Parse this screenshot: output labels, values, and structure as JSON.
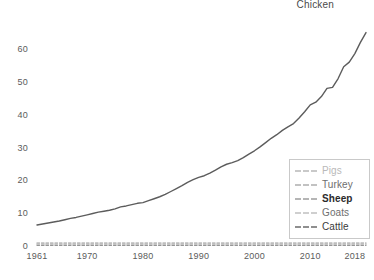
{
  "chart_data": {
    "type": "line",
    "title": "",
    "xlabel": "",
    "ylabel": "",
    "xlim": [
      1961,
      2020
    ],
    "ylim": [
      0,
      70
    ],
    "grid": false,
    "legend_position": "inside-bottom-right",
    "y_ticks": [
      0,
      10,
      20,
      30,
      40,
      50,
      60
    ],
    "y_tick_labels": [
      "0",
      "10",
      "20",
      "30",
      "40",
      "50",
      "60"
    ],
    "x_ticks": [
      1961,
      1970,
      1980,
      1990,
      2000,
      2010,
      2018
    ],
    "x_tick_labels": [
      "1961",
      "1970",
      "1980",
      "1990",
      "2000",
      "2010",
      "2018"
    ],
    "annotations": [
      {
        "text": "Chicken",
        "x": 2014,
        "y": 69
      }
    ],
    "x": [
      1961,
      1962,
      1963,
      1964,
      1965,
      1966,
      1967,
      1968,
      1969,
      1970,
      1971,
      1972,
      1973,
      1974,
      1975,
      1976,
      1977,
      1978,
      1979,
      1980,
      1981,
      1982,
      1983,
      1984,
      1985,
      1986,
      1987,
      1988,
      1989,
      1990,
      1991,
      1992,
      1993,
      1994,
      1995,
      1996,
      1997,
      1998,
      1999,
      2000,
      2001,
      2002,
      2003,
      2004,
      2005,
      2006,
      2007,
      2008,
      2009,
      2010,
      2011,
      2012,
      2013,
      2014,
      2015,
      2016,
      2017,
      2018,
      2019,
      2020
    ],
    "series": [
      {
        "name": "Chicken",
        "color": "#5c5c5c",
        "style": "solid",
        "width": 1.4,
        "values": [
          6.4,
          6.7,
          7.0,
          7.3,
          7.6,
          8.0,
          8.4,
          8.7,
          9.1,
          9.5,
          9.9,
          10.3,
          10.6,
          10.9,
          11.3,
          11.9,
          12.2,
          12.6,
          13.0,
          13.2,
          13.8,
          14.4,
          15.0,
          15.7,
          16.6,
          17.5,
          18.4,
          19.4,
          20.2,
          20.9,
          21.4,
          22.2,
          23.1,
          24.1,
          24.9,
          25.4,
          26.0,
          26.9,
          28.0,
          29.0,
          30.2,
          31.5,
          32.8,
          33.9,
          35.2,
          36.3,
          37.3,
          39.0,
          40.9,
          43.0,
          43.8,
          45.5,
          48.0,
          48.3,
          51.0,
          54.6,
          56.0,
          58.6,
          62.0,
          65.0
        ]
      },
      {
        "name": "Pigs",
        "color": "#cfcfcf",
        "style": "dashed",
        "width": 1.2,
        "values": [
          1.0,
          1.0,
          1.0,
          1.0,
          1.0,
          1.0,
          1.0,
          1.0,
          1.0,
          1.0,
          1.0,
          1.0,
          1.0,
          1.0,
          1.0,
          1.0,
          1.0,
          1.0,
          1.0,
          1.0,
          1.0,
          1.0,
          1.0,
          1.0,
          1.0,
          1.0,
          1.0,
          1.0,
          1.0,
          1.0,
          1.0,
          1.0,
          1.0,
          1.0,
          1.0,
          1.0,
          1.0,
          1.0,
          1.0,
          1.0,
          1.0,
          1.0,
          1.0,
          1.0,
          1.0,
          1.0,
          1.0,
          1.0,
          1.0,
          1.0,
          1.0,
          1.0,
          1.0,
          1.0,
          1.0,
          1.0,
          1.0,
          1.0,
          1.0,
          1.0
        ]
      },
      {
        "name": "Turkey",
        "color": "#c4c4c4",
        "style": "dashed",
        "width": 1.2,
        "values": [
          0.8,
          0.8,
          0.8,
          0.8,
          0.8,
          0.8,
          0.8,
          0.8,
          0.8,
          0.8,
          0.8,
          0.8,
          0.8,
          0.8,
          0.8,
          0.8,
          0.8,
          0.8,
          0.8,
          0.8,
          0.8,
          0.8,
          0.8,
          0.8,
          0.8,
          0.8,
          0.8,
          0.8,
          0.8,
          0.8,
          0.8,
          0.8,
          0.8,
          0.8,
          0.8,
          0.8,
          0.8,
          0.8,
          0.8,
          0.8,
          0.8,
          0.8,
          0.8,
          0.8,
          0.8,
          0.8,
          0.8,
          0.8,
          0.8,
          0.8,
          0.8,
          0.8,
          0.8,
          0.8,
          0.8,
          0.8,
          0.8,
          0.8,
          0.8,
          0.8
        ]
      },
      {
        "name": "Sheep",
        "color": "#b5b5b5",
        "style": "dashed",
        "width": 1.2,
        "values": [
          0.6,
          0.6,
          0.6,
          0.6,
          0.6,
          0.6,
          0.6,
          0.6,
          0.6,
          0.6,
          0.6,
          0.6,
          0.6,
          0.6,
          0.6,
          0.6,
          0.6,
          0.6,
          0.6,
          0.6,
          0.6,
          0.6,
          0.6,
          0.6,
          0.6,
          0.6,
          0.6,
          0.6,
          0.6,
          0.6,
          0.6,
          0.6,
          0.6,
          0.6,
          0.6,
          0.6,
          0.6,
          0.6,
          0.6,
          0.6,
          0.6,
          0.6,
          0.6,
          0.6,
          0.6,
          0.6,
          0.6,
          0.6,
          0.6,
          0.6,
          0.6,
          0.6,
          0.6,
          0.6,
          0.6,
          0.6,
          0.6,
          0.6,
          0.6,
          0.6
        ]
      },
      {
        "name": "Goats",
        "color": "#d2d2d2",
        "style": "dashed",
        "width": 1.2,
        "values": [
          0.4,
          0.4,
          0.4,
          0.4,
          0.4,
          0.4,
          0.4,
          0.4,
          0.4,
          0.4,
          0.4,
          0.4,
          0.4,
          0.4,
          0.4,
          0.4,
          0.4,
          0.4,
          0.4,
          0.4,
          0.4,
          0.4,
          0.4,
          0.4,
          0.4,
          0.4,
          0.4,
          0.4,
          0.4,
          0.4,
          0.4,
          0.4,
          0.4,
          0.4,
          0.4,
          0.4,
          0.4,
          0.4,
          0.4,
          0.4,
          0.4,
          0.4,
          0.4,
          0.4,
          0.4,
          0.4,
          0.4,
          0.4,
          0.4,
          0.4,
          0.4,
          0.4,
          0.4,
          0.4,
          0.4,
          0.4,
          0.4,
          0.4,
          0.4,
          0.4
        ]
      },
      {
        "name": "Cattle",
        "color": "#969696",
        "style": "dashed",
        "width": 1.2,
        "values": [
          0.2,
          0.2,
          0.2,
          0.2,
          0.2,
          0.2,
          0.2,
          0.2,
          0.2,
          0.2,
          0.2,
          0.2,
          0.2,
          0.2,
          0.2,
          0.2,
          0.2,
          0.2,
          0.2,
          0.2,
          0.2,
          0.2,
          0.2,
          0.2,
          0.2,
          0.2,
          0.2,
          0.2,
          0.2,
          0.2,
          0.2,
          0.2,
          0.2,
          0.2,
          0.2,
          0.2,
          0.2,
          0.2,
          0.2,
          0.2,
          0.2,
          0.2,
          0.2,
          0.2,
          0.2,
          0.2,
          0.2,
          0.2,
          0.2,
          0.2,
          0.2,
          0.2,
          0.2,
          0.2,
          0.2,
          0.2,
          0.2,
          0.2,
          0.2,
          0.2
        ]
      }
    ]
  },
  "legend": {
    "items": [
      {
        "label": "Pigs"
      },
      {
        "label": "Turkey"
      },
      {
        "label": "Sheep"
      },
      {
        "label": "Goats"
      },
      {
        "label": "Cattle"
      }
    ]
  }
}
